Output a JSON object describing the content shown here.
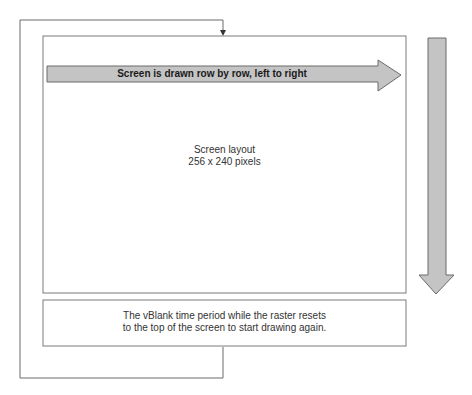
{
  "diagram": {
    "horizontal_arrow": {
      "label": "Screen is drawn row by row, left to right"
    },
    "screen_box": {
      "title": "Screen layout",
      "size": "256 x 240 pixels"
    },
    "vblank_box": {
      "line1": "The vBlank time period while the raster resets",
      "line2": "to the top of the screen to start drawing again."
    },
    "vertical_arrow": {
      "direction": "down"
    },
    "feedback_loop": {
      "direction": "return-to-top"
    },
    "colors": {
      "arrow_fill": "#c4c4c4",
      "arrow_stroke": "#6a6a6a",
      "box_stroke": "#7a7a7a",
      "line_stroke": "#6a6a6a",
      "background": "#ffffff"
    }
  }
}
